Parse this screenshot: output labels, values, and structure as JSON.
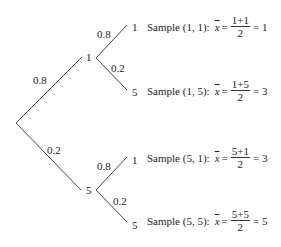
{
  "tree": {
    "level1": [
      {
        "prob": "0.8",
        "value": "1"
      },
      {
        "prob": "0.2",
        "value": "5"
      }
    ],
    "level2": [
      {
        "prob": "0.8",
        "value": "1"
      },
      {
        "prob": "0.2",
        "value": "5"
      },
      {
        "prob": "0.8",
        "value": "1"
      },
      {
        "prob": "0.2",
        "value": "5"
      }
    ]
  },
  "samples": [
    {
      "label": "Sample (1, 1):",
      "xbar": "x",
      "eq": "=",
      "numerator": "1+1",
      "denominator": "2",
      "result": "= 1"
    },
    {
      "label": "Sample (1, 5):",
      "xbar": "x",
      "eq": "=",
      "numerator": "1+5",
      "denominator": "2",
      "result": "= 3"
    },
    {
      "label": "Sample (5, 1):",
      "xbar": "x",
      "eq": "=",
      "numerator": "5+1",
      "denominator": "2",
      "result": "= 3"
    },
    {
      "label": "Sample (5, 5):",
      "xbar": "x",
      "eq": "=",
      "numerator": "5+5",
      "denominator": "2",
      "result": "= 5"
    }
  ]
}
